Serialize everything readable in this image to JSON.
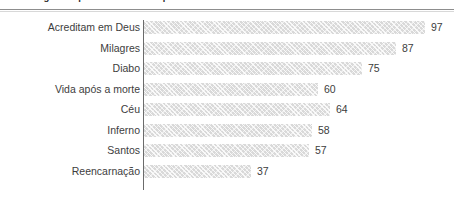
{
  "chart_data": {
    "type": "bar",
    "orientation": "horizontal",
    "title": "Porcentagem de pessoas no Brasil que acreditam nos itens descritos.",
    "xlabel": "",
    "ylabel": "",
    "xlim": [
      0,
      100
    ],
    "grid": false,
    "legend": null,
    "categories": [
      "Acreditam em Deus",
      "Milagres",
      "Diabo",
      "Vida após a morte",
      "Céu",
      "Inferno",
      "Santos",
      "Reencarnação"
    ],
    "values": [
      97,
      87,
      75,
      60,
      64,
      58,
      57,
      37
    ],
    "value_labels": [
      "97",
      "87",
      "75",
      "60",
      "64",
      "58",
      "57",
      "37"
    ],
    "bar_color": "#d9d9d9",
    "bar_pattern": "diagonal-hatch",
    "axis_color": "#6b6b6b",
    "text_color": "#3d3d3d"
  }
}
